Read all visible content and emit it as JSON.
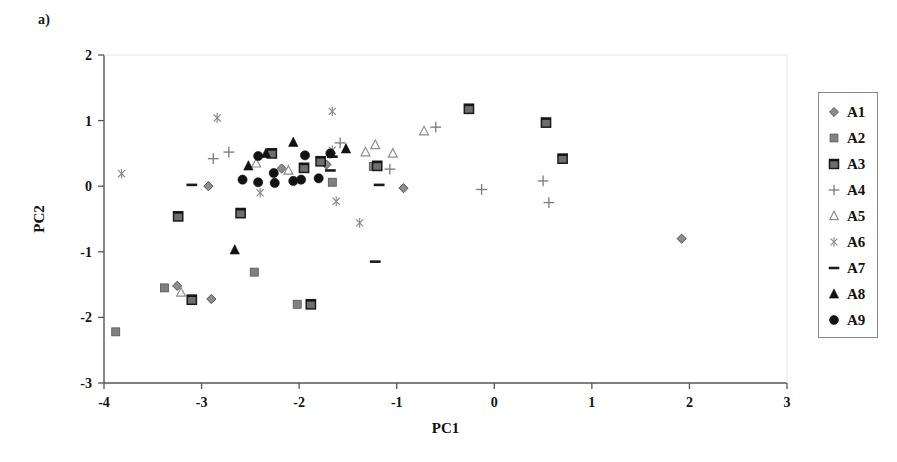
{
  "panel": {
    "label": "a)"
  },
  "legend": {
    "position": "right",
    "items": [
      {
        "label": "A1",
        "marker": "diamond",
        "color": "#8d8d8d"
      },
      {
        "label": "A2",
        "marker": "square",
        "color": "#808080"
      },
      {
        "label": "A3",
        "marker": "square-capped",
        "color": "#6e6e6e"
      },
      {
        "label": "A4",
        "marker": "plus",
        "color": "#7a7a7a"
      },
      {
        "label": "A5",
        "marker": "triangle-open",
        "color": "#8f8f8f"
      },
      {
        "label": "A6",
        "marker": "asterisk",
        "color": "#8a8a8a"
      },
      {
        "label": "A7",
        "marker": "dash",
        "color": "#1c1c1c"
      },
      {
        "label": "A8",
        "marker": "triangle-filled",
        "color": "#111111"
      },
      {
        "label": "A9",
        "marker": "circle-filled",
        "color": "#121212"
      }
    ]
  },
  "chart_data": {
    "type": "scatter",
    "title": "",
    "xlabel": "PC1",
    "ylabel": "PC2",
    "xlim": [
      -4,
      3
    ],
    "ylim": [
      -3,
      2
    ],
    "xticks": [
      -4,
      -3,
      -2,
      -1,
      0,
      1,
      2,
      3
    ],
    "yticks": [
      -3,
      -2,
      -1,
      0,
      1,
      2
    ],
    "xtick_labels": [
      "-4",
      "-3",
      "-2",
      "-1",
      "0",
      "1",
      "2",
      "3"
    ],
    "ytick_labels": [
      "-3",
      "-2",
      "-1",
      "0",
      "1",
      "2"
    ],
    "grid": false,
    "frame": "left-bottom",
    "series": [
      {
        "name": "A1",
        "marker": "diamond",
        "color": "#8d8d8d",
        "points": [
          [
            -2.93,
            0.0
          ],
          [
            -3.25,
            -1.52
          ],
          [
            -2.9,
            -1.72
          ],
          [
            -0.93,
            -0.03
          ],
          [
            1.92,
            -0.8
          ],
          [
            -1.72,
            0.33
          ],
          [
            -2.18,
            0.27
          ]
        ]
      },
      {
        "name": "A2",
        "marker": "square",
        "color": "#808080",
        "points": [
          [
            -3.88,
            -2.22
          ],
          [
            -3.38,
            -1.55
          ],
          [
            -2.02,
            -1.8
          ],
          [
            -2.46,
            -1.31
          ],
          [
            -1.66,
            0.06
          ],
          [
            -1.24,
            0.3
          ]
        ]
      },
      {
        "name": "A3",
        "marker": "square-capped",
        "color": "#6e6e6e",
        "points": [
          [
            -3.24,
            -0.46
          ],
          [
            -2.6,
            -0.41
          ],
          [
            -2.28,
            0.5
          ],
          [
            -1.95,
            0.28
          ],
          [
            -1.78,
            0.38
          ],
          [
            -1.2,
            0.31
          ],
          [
            -0.26,
            1.18
          ],
          [
            0.53,
            0.97
          ],
          [
            0.7,
            0.42
          ],
          [
            -3.1,
            -1.73
          ],
          [
            -1.88,
            -1.8
          ]
        ]
      },
      {
        "name": "A4",
        "marker": "plus",
        "color": "#7a7a7a",
        "points": [
          [
            -2.88,
            0.42
          ],
          [
            -2.72,
            0.52
          ],
          [
            -1.07,
            0.26
          ],
          [
            -0.6,
            0.9
          ],
          [
            -0.13,
            -0.05
          ],
          [
            0.5,
            0.08
          ],
          [
            0.56,
            -0.25
          ],
          [
            -1.58,
            0.66
          ]
        ]
      },
      {
        "name": "A5",
        "marker": "triangle-open",
        "color": "#8f8f8f",
        "points": [
          [
            -3.21,
            -1.62
          ],
          [
            -2.44,
            0.35
          ],
          [
            -2.11,
            0.24
          ],
          [
            -1.32,
            0.52
          ],
          [
            -1.22,
            0.63
          ],
          [
            -0.72,
            0.84
          ],
          [
            -1.04,
            0.5
          ]
        ]
      },
      {
        "name": "A6",
        "marker": "asterisk",
        "color": "#8a8a8a",
        "points": [
          [
            -3.82,
            0.19
          ],
          [
            -2.84,
            1.04
          ],
          [
            -2.4,
            -0.1
          ],
          [
            -1.66,
            1.14
          ],
          [
            -1.62,
            -0.23
          ],
          [
            -1.38,
            -0.56
          ],
          [
            -1.66,
            0.55
          ]
        ]
      },
      {
        "name": "A7",
        "marker": "dash",
        "color": "#1c1c1c",
        "points": [
          [
            -3.1,
            0.02
          ],
          [
            -1.66,
            0.45
          ],
          [
            -1.68,
            0.24
          ],
          [
            -1.18,
            0.02
          ],
          [
            -1.22,
            -1.15
          ]
        ]
      },
      {
        "name": "A8",
        "marker": "triangle-filled",
        "color": "#111111",
        "points": [
          [
            -2.52,
            0.31
          ],
          [
            -2.34,
            0.5
          ],
          [
            -2.06,
            0.67
          ],
          [
            -1.52,
            0.57
          ],
          [
            -2.66,
            -0.97
          ]
        ]
      },
      {
        "name": "A9",
        "marker": "circle-filled",
        "color": "#121212",
        "points": [
          [
            -2.26,
            0.2
          ],
          [
            -2.25,
            0.05
          ],
          [
            -2.42,
            0.46
          ],
          [
            -2.06,
            0.08
          ],
          [
            -1.94,
            0.47
          ],
          [
            -2.42,
            0.06
          ],
          [
            -1.98,
            0.1
          ],
          [
            -1.8,
            0.12
          ],
          [
            -1.68,
            0.5
          ],
          [
            -2.58,
            0.1
          ]
        ]
      }
    ]
  }
}
